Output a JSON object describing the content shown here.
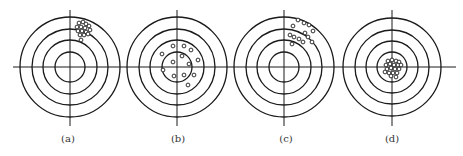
{
  "figure": {
    "horizontal_axis": {
      "x1": 13,
      "x2": 456,
      "y": 67
    },
    "ink_color": "#1a1a1a",
    "targets": [
      {
        "id": "a",
        "label": "(a)",
        "cx": 70,
        "cy": 67,
        "rings": [
          50,
          38,
          27,
          15
        ],
        "vertical_axis": [
          10,
          126
        ],
        "label_x": 68,
        "shots": [
          [
            9,
            -44
          ],
          [
            13,
            -45
          ],
          [
            16,
            -43
          ],
          [
            7,
            -40
          ],
          [
            11,
            -40
          ],
          [
            15,
            -39
          ],
          [
            19,
            -41
          ],
          [
            8,
            -36
          ],
          [
            12,
            -36
          ],
          [
            16,
            -35
          ],
          [
            20,
            -37
          ],
          [
            10,
            -32
          ],
          [
            14,
            -32
          ],
          [
            18,
            -33
          ],
          [
            11,
            -27
          ]
        ]
      },
      {
        "id": "b",
        "label": "(b)",
        "cx": 177,
        "cy": 67,
        "rings": [
          50,
          38,
          27,
          15
        ],
        "vertical_axis": [
          10,
          126
        ],
        "label_x": 178,
        "shots": [
          [
            -4,
            -21
          ],
          [
            7,
            -21
          ],
          [
            14,
            -17
          ],
          [
            -15,
            -13
          ],
          [
            5,
            -11
          ],
          [
            21,
            -7
          ],
          [
            -4,
            -5
          ],
          [
            12,
            -3
          ],
          [
            -14,
            3
          ],
          [
            -3,
            9
          ],
          [
            7,
            8
          ],
          [
            17,
            8
          ],
          [
            11,
            18
          ]
        ]
      },
      {
        "id": "c",
        "label": "(c)",
        "cx": 284,
        "cy": 67,
        "rings": [
          50,
          38,
          27,
          15
        ],
        "vertical_axis": [
          10,
          126
        ],
        "label_x": 286,
        "shots": [
          [
            14,
            -47
          ],
          [
            20,
            -44
          ],
          [
            25,
            -42
          ],
          [
            9,
            -41
          ],
          [
            29,
            -36
          ],
          [
            21,
            -34
          ],
          [
            24,
            -30
          ],
          [
            6,
            -32
          ],
          [
            10,
            -30
          ],
          [
            15,
            -28
          ],
          [
            19,
            -25
          ],
          [
            28,
            -25
          ],
          [
            8,
            -23
          ]
        ]
      },
      {
        "id": "d",
        "label": "(d)",
        "cx": 392,
        "cy": 67,
        "rings": [
          49,
          37,
          26,
          15
        ],
        "vertical_axis": [
          10,
          126
        ],
        "label_x": 392,
        "shots": [
          [
            -4,
            -6
          ],
          [
            0,
            -7
          ],
          [
            4,
            -6
          ],
          [
            7,
            -5
          ],
          [
            -6,
            -2
          ],
          [
            -2,
            -3
          ],
          [
            2,
            -2
          ],
          [
            6,
            -2
          ],
          [
            9,
            -2
          ],
          [
            -5,
            2
          ],
          [
            -1,
            1
          ],
          [
            3,
            2
          ],
          [
            7,
            2
          ],
          [
            -7,
            5
          ],
          [
            -3,
            6
          ],
          [
            1,
            6
          ],
          [
            5,
            6
          ],
          [
            -1,
            9
          ],
          [
            4,
            10
          ]
        ]
      }
    ],
    "label_y": 142
  }
}
